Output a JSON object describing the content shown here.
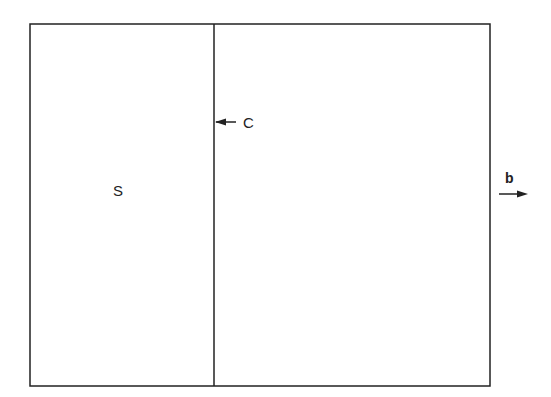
{
  "diagram": {
    "regions": [
      {
        "id": "left",
        "label": "S"
      },
      {
        "id": "right",
        "label": ""
      }
    ],
    "annotations": [
      {
        "id": "boundary",
        "label": "C",
        "arrow": "points-left-to-divider"
      },
      {
        "id": "vector",
        "label": "b",
        "arrow": "points-right"
      }
    ],
    "colors": {
      "line": "#222222",
      "background": "#ffffff"
    }
  }
}
